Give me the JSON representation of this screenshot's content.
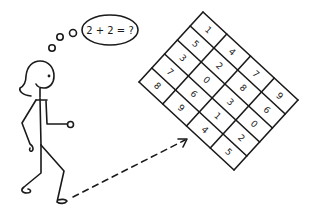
{
  "thought": {
    "text": "2 + 2 = ?",
    "bubble_center": [
      110,
      30
    ],
    "bubble_rx": 28,
    "bubble_ry": 15,
    "trail_circles": [
      {
        "cx": 73,
        "cy": 33,
        "r": 3.5
      },
      {
        "cx": 60,
        "cy": 37,
        "r": 3.2
      },
      {
        "cx": 52,
        "cy": 48,
        "r": 3.2
      }
    ]
  },
  "grid": {
    "top_corner": [
      203,
      12
    ],
    "col_vector": [
      23.75,
      22
    ],
    "row_vector": [
      -12.8,
      14
    ],
    "rows": 5,
    "cols": 4,
    "text_rotation_deg": 42.8,
    "cells": [
      [
        1,
        4,
        7,
        9
      ],
      [
        5,
        2,
        8,
        6
      ],
      [
        3,
        0,
        3,
        0
      ],
      [
        7,
        6,
        1,
        2
      ],
      [
        8,
        9,
        4,
        5
      ]
    ]
  },
  "arrow": {
    "from": [
      73,
      197
    ],
    "to": [
      187,
      139
    ],
    "style": "dashed"
  },
  "colors": {
    "ink": "#1a1a1a",
    "background": "#ffffff"
  }
}
